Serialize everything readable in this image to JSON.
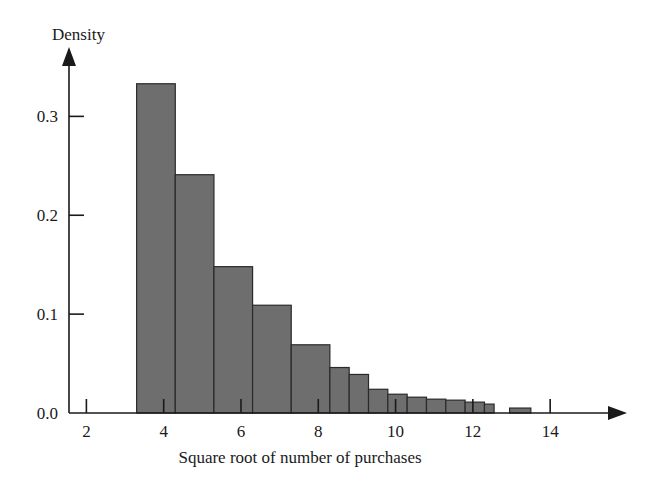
{
  "chart_data": {
    "type": "bar",
    "title": "",
    "xlabel": "Square root of number of purchases",
    "ylabel": "Density",
    "xlim": [
      1.55,
      15.6
    ],
    "ylim": [
      0.0,
      0.355
    ],
    "grid": false,
    "legend": null,
    "bin_width": 0.5,
    "xticks": [
      2,
      4,
      6,
      8,
      10,
      12,
      14
    ],
    "xtick_labels": [
      "2",
      "4",
      "6",
      "8",
      "10",
      "12",
      "14"
    ],
    "yticks": [
      0.0,
      0.1,
      0.2,
      0.3
    ],
    "ytick_labels": [
      "0.0",
      "0.1",
      "0.2",
      "0.3"
    ],
    "bin_edges": [
      3.3,
      3.8,
      4.3,
      4.8,
      5.3,
      5.8,
      6.3,
      6.8,
      7.3,
      7.8,
      8.3,
      8.8,
      9.3,
      9.8,
      10.3,
      10.8,
      11.3,
      11.8,
      12.3,
      12.8
    ],
    "categories": [
      "3.3-3.8",
      "3.8-4.3",
      "4.3-4.8",
      "4.8-5.3",
      "5.3-5.8",
      "5.8-6.3",
      "6.3-6.8",
      "6.8-7.3",
      "7.3-7.8",
      "7.8-8.3",
      "8.3-8.8",
      "8.8-9.3",
      "9.3-9.8",
      "9.8-10.3",
      "10.3-10.8",
      "10.8-11.3",
      "11.3-11.8",
      "11.8-12.3",
      "12.3-12.8"
    ],
    "values": [
      0.333,
      0.333,
      0.241,
      0.241,
      0.148,
      0.148,
      0.109,
      0.109,
      0.069,
      0.069,
      0.046,
      0.046,
      0.024,
      0.024,
      0.016,
      0.013,
      0.011,
      0.009,
      0.005
    ],
    "bars": [
      {
        "x0": 3.3,
        "x1": 4.3,
        "height": 0.333
      },
      {
        "x0": 4.3,
        "x1": 5.3,
        "height": 0.241
      },
      {
        "x0": 5.3,
        "x1": 6.3,
        "height": 0.148
      },
      {
        "x0": 6.3,
        "x1": 7.3,
        "height": 0.109
      },
      {
        "x0": 7.3,
        "x1": 8.3,
        "height": 0.069
      },
      {
        "x0": 8.3,
        "x1": 8.8,
        "height": 0.046
      },
      {
        "x0": 8.8,
        "x1": 9.3,
        "height": 0.039
      },
      {
        "x0": 9.3,
        "x1": 9.8,
        "height": 0.024
      },
      {
        "x0": 9.8,
        "x1": 10.3,
        "height": 0.019
      },
      {
        "x0": 10.3,
        "x1": 10.8,
        "height": 0.016
      },
      {
        "x0": 10.8,
        "x1": 11.3,
        "height": 0.014
      },
      {
        "x0": 11.3,
        "x1": 11.8,
        "height": 0.013
      },
      {
        "x0": 11.8,
        "x1": 12.3,
        "height": 0.011
      },
      {
        "x0": 12.3,
        "x1": 12.55,
        "height": 0.009
      },
      {
        "x0": 12.95,
        "x1": 13.5,
        "height": 0.005
      }
    ],
    "colors": {
      "bar_fill": "#6e6e6e",
      "bar_edge": "#2a2a2a",
      "axis": "#1a1a1a",
      "text": "#1a1a1a",
      "background": "#ffffff"
    }
  }
}
